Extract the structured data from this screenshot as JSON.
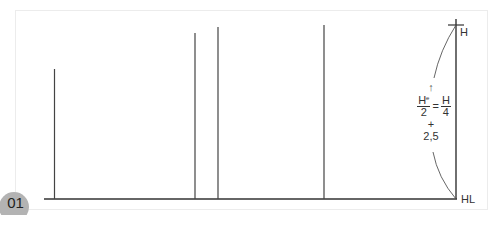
{
  "figure": {
    "number": "01",
    "labels": {
      "top": "H",
      "bottom": "HL"
    },
    "formula": {
      "arrow": "↑",
      "lhs_numerator": "H",
      "lhs_numerator_superscript": "e",
      "lhs_denominator": "2",
      "equals": "=",
      "rhs_numerator": "H",
      "rhs_denominator": "4",
      "plus": "+",
      "constant": "2,5"
    },
    "colors": {
      "line": "#333333",
      "frame": "#ececec",
      "badge": "#b3b3b3"
    },
    "baseline": {
      "y": 199,
      "x1": 44,
      "x2": 456
    },
    "verticals": [
      {
        "x": 54,
        "top": 69
      },
      {
        "x": 195,
        "top": 33
      },
      {
        "x": 218,
        "top": 27
      },
      {
        "x": 324,
        "top": 25
      },
      {
        "x": 456,
        "top": 19
      }
    ]
  }
}
